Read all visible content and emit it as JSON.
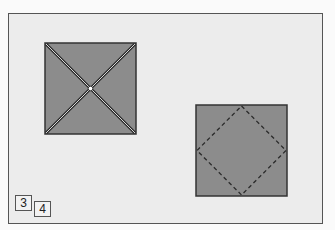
{
  "diagram": {
    "type": "origami-instructions",
    "colors": {
      "background": "#ececec",
      "paper": "#8c8c8c",
      "outline": "#333333",
      "frame": "#555555"
    },
    "figures": [
      {
        "id": "step-3",
        "description": "square with both diagonals folded (valley creases) and center point marked",
        "lines": [
          "diagonal-valley-crease",
          "diagonal-valley-crease"
        ]
      },
      {
        "id": "step-4",
        "description": "square with dashed diamond connecting edge midpoints (valley fold lines)",
        "lines": [
          "dashed-fold-line"
        ]
      }
    ],
    "step_labels": [
      "3",
      "4"
    ]
  }
}
